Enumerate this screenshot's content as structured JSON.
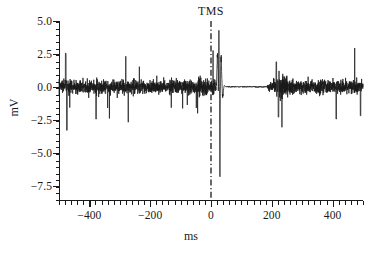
{
  "figure": {
    "background_color": "#ffffff",
    "line_color": "#1a1a1a"
  },
  "chart_data": {
    "type": "line",
    "title": "",
    "subtitle": "",
    "xlabel": "ms",
    "ylabel": "mV",
    "xlim": [
      -500,
      500
    ],
    "ylim": [
      -8.6,
      5.0
    ],
    "grid": false,
    "legend": null,
    "x_ticks": [
      -400,
      -200,
      0,
      200,
      400
    ],
    "x_tick_labels": [
      "−400",
      "−200",
      "0",
      "200",
      "400"
    ],
    "x_minor_tick_step": 20,
    "y_ticks": [
      5.0,
      2.5,
      0.0,
      -2.5,
      -5.0,
      -7.5
    ],
    "y_tick_labels": [
      "5.0",
      "2.5",
      "0.0",
      "−2.5",
      "−5.0",
      "−7.5"
    ],
    "y_minor_tick_step": 0.5,
    "annotations": [
      {
        "text": "TMS",
        "x": 0,
        "y": 5.0,
        "line_style": "dash-dot",
        "line_x": 0,
        "description": "vertical dash-dot marker at time zero indicating the TMS pulse"
      }
    ],
    "series": [
      {
        "name": "EMG",
        "units": "mV",
        "description": "Surface EMG trace: tonic background activity before the TMS pulse, a large biphasic motor evoked potential just after 0 ms, a cortical silent period of near-zero activity from about 50 ms to 185 ms, then a burst of returning EMG activity and resumed tonic activity.",
        "features": {
          "mep_onset_ms": 18,
          "mep_peak_positive_mv": 4.3,
          "mep_peak_negative_mv": -6.9,
          "silent_period_start_ms": 50,
          "silent_period_end_ms": 185,
          "background_rms_mv": 0.45,
          "background_peak_mv": 2.6,
          "background_trough_mv": -3.3,
          "return_burst_center_ms": 215,
          "return_burst_peak_mv": 1.9,
          "return_burst_trough_mv": -2.3
        }
      }
    ]
  },
  "axis_titles": {
    "x": "ms",
    "y": "mV"
  },
  "event": {
    "label": "TMS"
  }
}
